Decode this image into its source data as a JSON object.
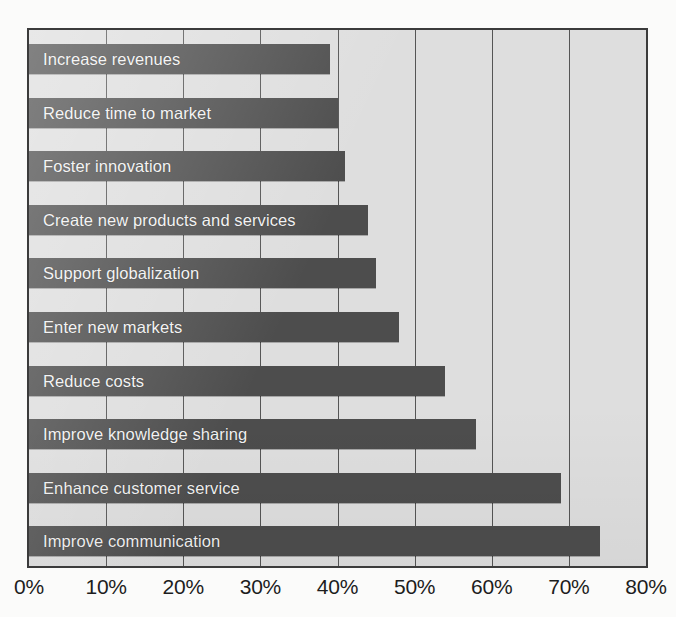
{
  "chart_data": {
    "type": "bar",
    "orientation": "horizontal",
    "title": "",
    "subtitle": "",
    "xlabel": "",
    "ylabel": "",
    "xlim": [
      0,
      80
    ],
    "grid": true,
    "legend": null,
    "categories": [
      "Increase revenues",
      "Reduce time to market",
      "Foster innovation",
      "Create new products and services",
      "Support globalization",
      "Enter new markets",
      "Reduce costs",
      "Improve knowledge sharing",
      "Enhance customer service",
      "Improve communication"
    ],
    "values": [
      39,
      40,
      41,
      44,
      45,
      48,
      54,
      58,
      69,
      74
    ],
    "value_unit": "%",
    "xticks": [
      0,
      10,
      20,
      30,
      40,
      50,
      60,
      70,
      80
    ],
    "xtick_labels": [
      "0%",
      "10%",
      "20%",
      "30%",
      "40%",
      "50%",
      "60%",
      "70%",
      "80%"
    ],
    "colors": {
      "bar": "#4d4d4d",
      "plot_background": "#dedede",
      "page_background": "#fbfbfa",
      "grid": "#555555",
      "frame": "#3b3b3b",
      "bar_label_text": "#f2f2f2",
      "tick_label_text": "#1d1d1d"
    }
  }
}
